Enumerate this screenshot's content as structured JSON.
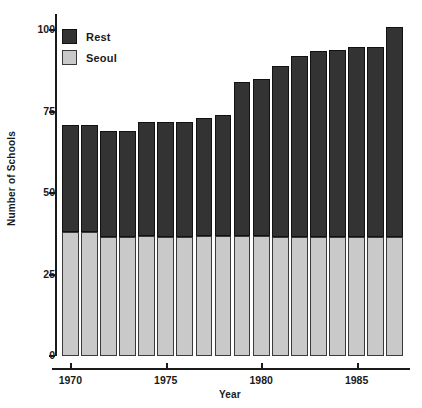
{
  "chart_data": {
    "type": "bar",
    "subtype": "stacked-bar",
    "title": "",
    "xlabel": "Year",
    "ylabel": "Number of Schools",
    "categories": [
      1970,
      1971,
      1972,
      1973,
      1974,
      1975,
      1976,
      1977,
      1978,
      1979,
      1980,
      1981,
      1982,
      1983,
      1984,
      1985,
      1986,
      1987
    ],
    "series": [
      {
        "name": "Seoul",
        "color": "#c9c9c9",
        "values": [
          38,
          38,
          36.5,
          36.5,
          37,
          36.5,
          36.5,
          37,
          37,
          37,
          37,
          36.5,
          36.5,
          36.5,
          36.5,
          36.5,
          36.5,
          36.5
        ]
      },
      {
        "name": "Rest",
        "color": "#333333",
        "values": [
          33,
          33,
          32.5,
          32.5,
          35,
          35.5,
          35.5,
          36,
          37,
          47,
          48,
          52.5,
          55.5,
          57,
          57.5,
          58.5,
          58.5,
          64.5
        ]
      }
    ],
    "totals": [
      71,
      71,
      69,
      69,
      72,
      72,
      72,
      73,
      74,
      84,
      85,
      89,
      92,
      93.5,
      94,
      95,
      95,
      101
    ],
    "stack_order": [
      "Seoul",
      "Rest"
    ],
    "ylim": [
      0,
      105
    ],
    "yticks": [
      0,
      25,
      50,
      75,
      100
    ],
    "ytick_labels": [
      "0",
      "25",
      "50",
      "75",
      "100"
    ],
    "xlim": [
      1969.3,
      1987.8
    ],
    "xticks": [
      1970,
      1975,
      1980,
      1985
    ],
    "xtick_labels": [
      "1970",
      "1975",
      "1980",
      "1985"
    ],
    "grid": false,
    "legend": {
      "position": "top-left-inside",
      "entries": [
        {
          "label": "Rest",
          "color": "#333333",
          "icon": "legend-swatch-dark"
        },
        {
          "label": "Seoul",
          "color": "#c9c9c9",
          "icon": "legend-swatch-gray"
        }
      ]
    }
  },
  "axes": {
    "y_title": "Number of Schools",
    "x_title": "Year"
  }
}
